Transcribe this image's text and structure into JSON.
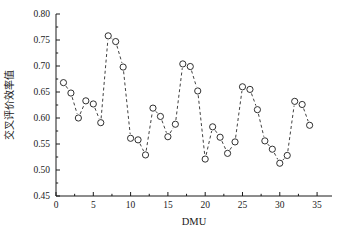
{
  "chart_data": {
    "type": "scatter",
    "title": "",
    "subtitle": "",
    "xlabel": "DMU",
    "ylabel": "交叉评价效率值",
    "xlim": [
      0,
      37
    ],
    "ylim": [
      0.45,
      0.8
    ],
    "xticks": [
      0,
      5,
      10,
      15,
      20,
      25,
      30,
      35
    ],
    "xtick_labels": [
      "0",
      "5",
      "10",
      "15",
      "20",
      "25",
      "30",
      "35"
    ],
    "yticks": [
      0.45,
      0.5,
      0.55,
      0.6,
      0.65,
      0.7,
      0.75,
      0.8
    ],
    "ytick_labels": [
      "0.45",
      "0.50",
      "0.55",
      "0.60",
      "0.65",
      "0.70",
      "0.75",
      "0.80"
    ],
    "grid": false,
    "legend": null,
    "legend_position": "none",
    "marker_style": "open-circle",
    "line_style": "dashed",
    "series": [
      {
        "name": "交叉评价效率值",
        "x": [
          1,
          2,
          3,
          4,
          5,
          6,
          7,
          8,
          9,
          10,
          11,
          12,
          13,
          14,
          15,
          16,
          17,
          18,
          19,
          20,
          21,
          22,
          23,
          24,
          25,
          26,
          27,
          28,
          29,
          30,
          31,
          32,
          33,
          34
        ],
        "values": [
          0.668,
          0.648,
          0.6,
          0.633,
          0.627,
          0.591,
          0.758,
          0.747,
          0.698,
          0.561,
          0.558,
          0.529,
          0.619,
          0.603,
          0.564,
          0.588,
          0.704,
          0.699,
          0.652,
          0.521,
          0.583,
          0.563,
          0.532,
          0.554,
          0.66,
          0.655,
          0.616,
          0.556,
          0.54,
          0.513,
          0.528,
          0.632,
          0.626,
          0.586
        ]
      }
    ]
  },
  "axes": {
    "x_title": "DMU",
    "y_title": "交叉评价效率值"
  }
}
